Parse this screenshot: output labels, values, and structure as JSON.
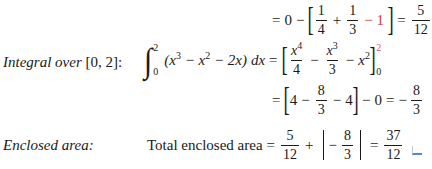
{
  "rows": [
    {
      "id": "step1",
      "label": "",
      "eq1": "=",
      "zero": "0",
      "minus": "−",
      "frac_a": {
        "num": "1",
        "den": "4"
      },
      "plus": "+",
      "frac_b": {
        "num": "1",
        "den": "3"
      },
      "highlight_term": "− 1",
      "eq2": "=",
      "result": {
        "num": "5",
        "den": "12"
      }
    },
    {
      "id": "integral",
      "label_italic": "Integral over",
      "label_interval": "[0, 2]:",
      "int_upper": "2",
      "int_lower": "0",
      "integrand_open": "(x",
      "integrand_p1": "3",
      "integrand_m1": " − x",
      "integrand_p2": "2",
      "integrand_rest": " − 2x)",
      "dx": "dx",
      "eq": "=",
      "antideriv_a": {
        "num_base": "x",
        "num_exp": "4",
        "den": "4"
      },
      "minus1": "−",
      "antideriv_b": {
        "num_base": "x",
        "num_exp": "3",
        "den": "3"
      },
      "minus2": "−",
      "antideriv_c_base": "x",
      "antideriv_c_exp": "2",
      "eval_upper": "2",
      "eval_lower": "0"
    },
    {
      "id": "step3",
      "eq1": "=",
      "four1": "4",
      "minus1": "−",
      "frac": {
        "num": "8",
        "den": "3"
      },
      "minus2": "−",
      "four2": "4",
      "minus3": "−",
      "zero": "0",
      "eq2": "=",
      "neg": "−",
      "result": {
        "num": "8",
        "den": "3"
      }
    },
    {
      "id": "area",
      "label": "Enclosed area:",
      "text": "Total enclosed area",
      "eq1": "=",
      "frac_a": {
        "num": "5",
        "den": "12"
      },
      "plus": "+",
      "neg": "−",
      "frac_b": {
        "num": "8",
        "den": "3"
      },
      "eq2": "=",
      "result": {
        "num": "37",
        "den": "12"
      }
    }
  ],
  "icons": {
    "corner": "bracket-corner-icon"
  },
  "colors": {
    "highlight_red": "#d03a3a",
    "limit_pink": "#d4507a",
    "icon_blue": "#5d86c8"
  }
}
